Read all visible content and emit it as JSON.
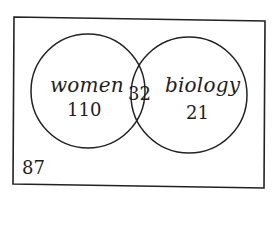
{
  "diagram": {
    "type": "venn",
    "colors": {
      "stroke": "#222222",
      "text": "#1e1e1e",
      "background": "#ffffff"
    },
    "sets": [
      {
        "name": "women",
        "only_count": "110"
      },
      {
        "name": "biology",
        "only_count": "21"
      }
    ],
    "intersection_count": "32",
    "outside_count": "87"
  }
}
